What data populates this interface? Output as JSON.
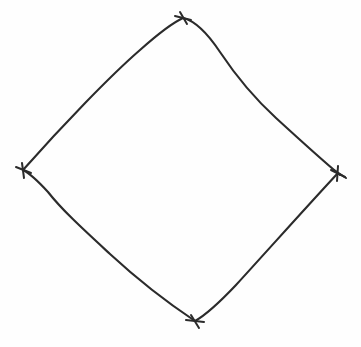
{
  "figure": {
    "shape_name": "diamond",
    "background_color": "#fefefe",
    "stroke_color": "#2b2b2b",
    "stroke_width": 2.1,
    "canvas": {
      "width": 361,
      "height": 347
    },
    "vertices": [
      {
        "name": "top-vertex",
        "label": "",
        "x": 183,
        "y": 18
      },
      {
        "name": "right-vertex",
        "label": "",
        "x": 338,
        "y": 173
      },
      {
        "name": "bottom-vertex",
        "label": "",
        "x": 195,
        "y": 321
      },
      {
        "name": "left-vertex",
        "label": "",
        "x": 23,
        "y": 170
      }
    ],
    "vertex_marker": {
      "type": "cross-tick",
      "arm_length": 7,
      "count": 4
    },
    "edges": [
      {
        "name": "edge-top-left",
        "from": "left-vertex",
        "to": "top-vertex",
        "curvature": "near-straight-slight-bow",
        "path": "M 23 170 C 62 126, 110 76, 140 50 C 158 34, 172 23, 183 18"
      },
      {
        "name": "edge-top-right",
        "from": "top-vertex",
        "to": "right-vertex",
        "curvature": "s-curve-outward-then-inward",
        "path": "M 183 18 C 196 21, 208 34, 220 52 C 236 76, 252 96, 276 118 C 300 140, 322 160, 340 175"
      },
      {
        "name": "edge-bottom-right",
        "from": "right-vertex",
        "to": "bottom-vertex",
        "curvature": "near-straight",
        "path": "M 338 173 C 310 203, 268 250, 236 285 C 218 304, 204 316, 195 321"
      },
      {
        "name": "edge-bottom-left",
        "from": "bottom-vertex",
        "to": "left-vertex",
        "curvature": "s-curve-outward-near-left",
        "path": "M 195 321 C 168 303, 136 278, 110 254 C 84 230, 62 210, 48 192 C 37 180, 29 173, 23 170"
      }
    ],
    "overshoots": [
      {
        "name": "overshoot-right-vertex",
        "path": "M 334 170 L 346 178"
      }
    ]
  }
}
